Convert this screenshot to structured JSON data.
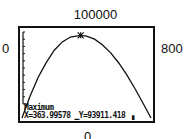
{
  "window": {
    "ymax_label": "100000",
    "xmin_label": "0",
    "xmax_label": "800",
    "ymin_label": "0"
  },
  "calc": {
    "title": "Maximum",
    "x_text": "X=363.99578",
    "y_text": "Y=93911.418"
  },
  "chart_data": {
    "type": "line",
    "title": "Maximum",
    "xlabel": "",
    "ylabel": "",
    "xlim": [
      0,
      800
    ],
    "ylim": [
      0,
      100000
    ],
    "grid": false,
    "y_ticks_count": 10,
    "annotation": {
      "x": 363.99578,
      "y": 93911.418,
      "label": "Maximum"
    },
    "series": [
      {
        "name": "curve",
        "x": [
          0,
          50,
          100,
          150,
          200,
          250,
          300,
          364,
          400,
          450,
          500,
          550,
          600,
          650,
          700,
          750,
          800
        ],
        "y": [
          0,
          25000,
          46000,
          63000,
          77000,
          86500,
          92000,
          93911,
          93000,
          89500,
          83000,
          74000,
          62500,
          49000,
          33500,
          17000,
          0
        ]
      }
    ]
  }
}
